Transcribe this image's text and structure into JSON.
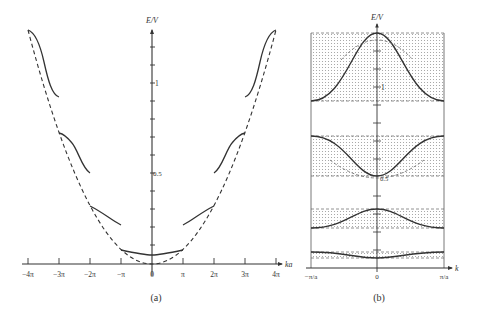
{
  "figure": {
    "panel_a": {
      "caption": "(a)",
      "y_axis_label": "E/V",
      "x_axis_label": "ka",
      "y_tick_labels": [
        {
          "value": 1,
          "label": "1"
        },
        {
          "value": 0.5,
          "label": "0.5"
        }
      ],
      "x_tick_labels": [
        "−4π",
        "−3π",
        "−2π",
        "−π",
        "0",
        "π",
        "2π",
        "3π",
        "4π"
      ],
      "curves": {
        "free_electron": "dashed parabola E ∝ (ka)²",
        "bands": "solid segments between multiples of π (extended zone scheme)"
      }
    },
    "panel_b": {
      "caption": "(b)",
      "y_axis_label": "E/V",
      "x_axis_label": "k",
      "y_tick_labels": [
        {
          "value": 1,
          "label": "1"
        },
        {
          "value": 0.5,
          "label": "0.5"
        }
      ],
      "x_tick_labels": [
        "−π/a",
        "0",
        "π/a"
      ],
      "curves": {
        "bands": "four cosine-like bands in reduced zone, shaded allowed-energy regions bounded by dashed lines"
      }
    }
  },
  "colors": {
    "line": "#333333",
    "shade_dot": "#9a9a9a",
    "background": "#ffffff"
  }
}
